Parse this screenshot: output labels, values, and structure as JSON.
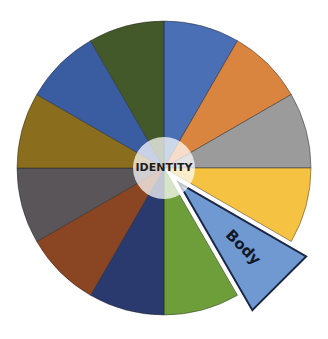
{
  "diagram": {
    "type": "segmented-wheel",
    "center": {
      "x": 164,
      "y": 168
    },
    "radius": 147,
    "hub": {
      "label": "IDENTITY",
      "radius": 31,
      "fill": "#ffffff",
      "opacity": 0.72,
      "text_color": "#1e1e1e"
    },
    "segments": [
      {
        "id": "seg-1",
        "start": 0,
        "end": 30,
        "color": "#4a6fb5",
        "label": ""
      },
      {
        "id": "seg-2",
        "start": 30,
        "end": 60,
        "color": "#d9843f",
        "label": ""
      },
      {
        "id": "seg-3",
        "start": 60,
        "end": 90,
        "color": "#9b9b9b",
        "label": ""
      },
      {
        "id": "seg-4",
        "start": 90,
        "end": 120,
        "color": "#f5c242",
        "label": ""
      },
      {
        "id": "seg-5",
        "start": 120,
        "end": 150,
        "color": "#6f99d0",
        "label": "Body",
        "exploded": true,
        "offset": 21,
        "stroke": "#1a2745",
        "outline": "#ffffff",
        "text_color": "#111827"
      },
      {
        "id": "seg-6",
        "start": 150,
        "end": 180,
        "color": "#6e9e3a",
        "label": ""
      },
      {
        "id": "seg-7",
        "start": 180,
        "end": 210,
        "color": "#2b3a6e",
        "label": ""
      },
      {
        "id": "seg-8",
        "start": 210,
        "end": 240,
        "color": "#8a4523",
        "label": ""
      },
      {
        "id": "seg-9",
        "start": 240,
        "end": 270,
        "color": "#5a5558",
        "label": ""
      },
      {
        "id": "seg-10",
        "start": 270,
        "end": 300,
        "color": "#8a6e1e",
        "label": ""
      },
      {
        "id": "seg-11",
        "start": 300,
        "end": 330,
        "color": "#3a5ca0",
        "label": ""
      },
      {
        "id": "seg-12",
        "start": 330,
        "end": 360,
        "color": "#44592a",
        "label": ""
      }
    ]
  }
}
